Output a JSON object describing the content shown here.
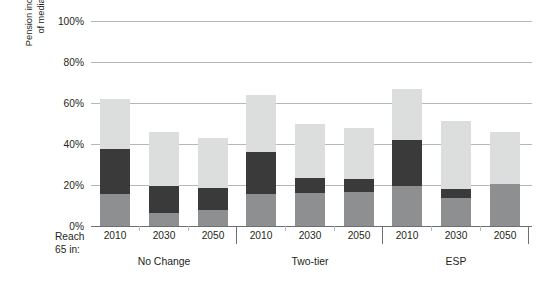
{
  "chart_data": {
    "type": "bar",
    "stacked": true,
    "title": "",
    "subtitle": "",
    "xlabel": "Reach 65 in:",
    "ylabel": "Pension income as percentage of median earnings at 75",
    "ylim": [
      0,
      100
    ],
    "ytick_labels": [
      "0%",
      "20%",
      "40%",
      "60%",
      "80%",
      "100%"
    ],
    "ytick_values": [
      0,
      20,
      40,
      60,
      80,
      100
    ],
    "grid": true,
    "legend_position": "none",
    "unit": "%",
    "categories": [
      "2010",
      "2030",
      "2050",
      "2010",
      "2030",
      "2050",
      "2010",
      "2030",
      "2050"
    ],
    "groups": [
      {
        "label": "No Change",
        "categories": [
          "2010",
          "2030",
          "2050"
        ]
      },
      {
        "label": "Two-tier",
        "categories": [
          "2010",
          "2030",
          "2050"
        ]
      },
      {
        "label": "ESP",
        "categories": [
          "2010",
          "2030",
          "2050"
        ]
      }
    ],
    "series": [
      {
        "name": "bottom-segment",
        "color": "#8e8f90",
        "values": [
          15.5,
          6.5,
          8.0,
          15.5,
          16.0,
          16.5,
          19.5,
          13.5,
          20.5
        ]
      },
      {
        "name": "middle-segment",
        "color": "#3a3a3a",
        "values": [
          22.0,
          13.0,
          10.5,
          20.5,
          7.5,
          6.5,
          22.5,
          4.5,
          0.0
        ]
      },
      {
        "name": "top-segment",
        "color": "#dcdddd",
        "values": [
          24.5,
          26.5,
          24.5,
          28.0,
          26.5,
          25.0,
          25.0,
          33.0,
          25.5
        ]
      }
    ],
    "totals": [
      62.0,
      46.0,
      43.0,
      64.0,
      50.0,
      48.0,
      67.0,
      51.0,
      46.0
    ],
    "colors": {
      "bottom": "#8e8f90",
      "middle": "#3a3a3a",
      "top": "#dcdddd",
      "gridline": "#b5b7b9",
      "axis": "#6d6e71",
      "text": "#231f20"
    }
  },
  "axis_title_lines": [
    "Pension income as percentage",
    "of median earnings at 75"
  ],
  "reach_label_lines": [
    "Reach",
    "65 in:"
  ]
}
